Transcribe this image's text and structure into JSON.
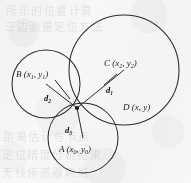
{
  "figure": {
    "background_color": "#f7f7f5",
    "ink_color": "#2b2b2b",
    "width": 191,
    "height": 183
  },
  "points": {
    "A": {
      "label_main": "A",
      "label_coords": "(x",
      "sub0": "0",
      "mid": ", y",
      "sub1": "0",
      "close": ")",
      "full_text": "A (x0, y0)",
      "x": 83,
      "y": 138,
      "name": "point-a-center"
    },
    "B": {
      "label_main": "B",
      "full_text": "B (x1, y1)",
      "sub0": "1",
      "sub1": "1",
      "x": 46,
      "y": 84,
      "name": "point-b-center"
    },
    "C": {
      "label_main": "C",
      "full_text": "C (x2, y2)",
      "sub0": "2",
      "sub1": "2",
      "x": 124,
      "y": 70,
      "name": "point-c-center"
    },
    "D": {
      "label_main": "D",
      "full_text": "D (x, y)",
      "x": 77,
      "y": 108,
      "name": "point-d-unknown"
    }
  },
  "labels": {
    "a_text_pre": "A (x",
    "a_sub_1": "0",
    "a_text_mid": ", y",
    "a_sub_2": "0",
    "a_text_post": ")",
    "b_text_pre": "B (x",
    "b_sub_1": "1",
    "b_text_mid": ", y",
    "b_sub_2": "1",
    "b_text_post": ")",
    "c_text_pre": "C (x",
    "c_sub_1": "2",
    "c_text_mid": ", y",
    "c_sub_2": "2",
    "c_text_post": ")",
    "d_text": "D (x, y)"
  },
  "distances": {
    "d1": {
      "base": "d",
      "sub": "1",
      "from": "C",
      "to": "D",
      "name": "distance-d1"
    },
    "d2": {
      "base": "d",
      "sub": "2",
      "from": "B",
      "to": "D",
      "name": "distance-d2"
    },
    "d3": {
      "base": "d",
      "sub": "3",
      "from": "A",
      "to": "D",
      "name": "distance-d3"
    }
  },
  "circles": [
    {
      "id": "circle-b",
      "center_label": "B",
      "cx": 46,
      "cy": 84,
      "r": 34,
      "name": "circle-around-b"
    },
    {
      "id": "circle-c",
      "center_label": "C",
      "cx": 124,
      "cy": 70,
      "r": 55,
      "name": "circle-around-c"
    },
    {
      "id": "circle-a",
      "center_label": "A",
      "cx": 83,
      "cy": 138,
      "r": 35,
      "name": "circle-around-a"
    }
  ],
  "ghost_background_text": [
    {
      "text": "所示的位置计算",
      "x": 6,
      "y": 2
    },
    {
      "text": "三边测量定位方法",
      "x": 4,
      "y": 18
    },
    {
      "text": "距离估计与节点",
      "x": 3,
      "y": 128
    },
    {
      "text": "定位精度分析结果",
      "x": 2,
      "y": 146
    },
    {
      "text": "无线传感器网络",
      "x": 2,
      "y": 164
    }
  ]
}
